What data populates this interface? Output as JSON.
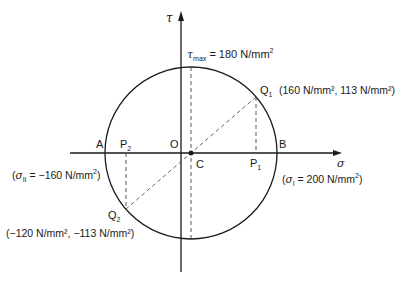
{
  "diagram": {
    "axes": {
      "horizontal_symbol": "σ",
      "vertical_symbol": "τ"
    },
    "points": {
      "origin": "O",
      "centre": "C",
      "left_intersection": "A",
      "right_intersection": "B",
      "p1": "P",
      "p1_sub": "1",
      "p2": "P",
      "p2_sub": "2",
      "q1": "Q",
      "q1_sub": "1",
      "q2": "Q",
      "q2_sub": "2"
    },
    "annotations": {
      "tau_max_symbol": "τ",
      "tau_max_sub": "max",
      "tau_max_value": " = 180 N/mm",
      "tau_max_exp": "2",
      "q1_coords": "(160 N/mm², 113 N/mm²)",
      "q2_coords": "(−120 N/mm², −113 N/mm²)",
      "sigma1_open": "(",
      "sigma1_symbol": "σ",
      "sigma1_sub": "I",
      "sigma1_value": " = 200 N/mm",
      "sigma1_exp": "2",
      "sigma1_close": ")",
      "sigma2_open": "(",
      "sigma2_symbol": "σ",
      "sigma2_sub": "II",
      "sigma2_value": " = −160 N/mm",
      "sigma2_exp": "2",
      "sigma2_close": ")"
    },
    "values": {
      "sigma_I": 200,
      "sigma_II": -160,
      "tau_max": 180,
      "Q1": [
        160,
        113
      ],
      "Q2": [
        -120,
        -113
      ],
      "units": "N/mm²"
    }
  }
}
